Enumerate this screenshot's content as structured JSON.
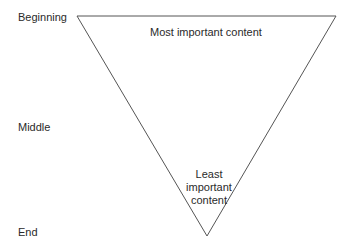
{
  "diagram": {
    "type": "inverted-pyramid",
    "stage_labels": [
      "Beginning",
      "Middle",
      "End"
    ],
    "top_text": "Most important content",
    "bottom_text_lines": [
      "Least",
      "important",
      "content"
    ],
    "stroke_color": "#555555",
    "text_color": "#2a2a2a"
  }
}
